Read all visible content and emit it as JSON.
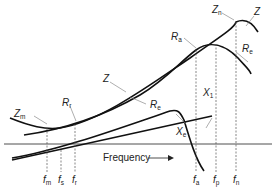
{
  "diagram": {
    "axis_label": "Frequency",
    "curves": [
      {
        "id": "Z",
        "label": "Z",
        "description": "impedance magnitude"
      },
      {
        "id": "Re",
        "label": "R",
        "sub": "e",
        "description": "equivalent resistance"
      },
      {
        "id": "Xe",
        "label": "X",
        "sub": "e",
        "description": "equivalent reactance"
      },
      {
        "id": "X1",
        "label": "X",
        "sub": "1",
        "description": "reactance line"
      }
    ],
    "points": [
      {
        "label": "Z",
        "sub": "m"
      },
      {
        "label": "R",
        "sub": "r"
      },
      {
        "label": "R",
        "sub": "a"
      },
      {
        "label": "Z",
        "sub": "n"
      },
      {
        "label": "R",
        "sub": "e"
      }
    ],
    "frequencies": [
      {
        "label": "f",
        "sub": "m"
      },
      {
        "label": "f",
        "sub": "s"
      },
      {
        "label": "f",
        "sub": "r"
      },
      {
        "label": "f",
        "sub": "a"
      },
      {
        "label": "f",
        "sub": "p"
      },
      {
        "label": "f",
        "sub": "n"
      }
    ]
  }
}
